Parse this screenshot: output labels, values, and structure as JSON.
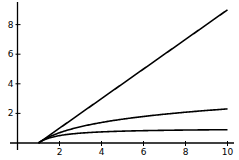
{
  "chart_data": {
    "type": "line",
    "title": "",
    "xlabel": "",
    "ylabel": "",
    "xlim": [
      0,
      10
    ],
    "ylim": [
      0,
      9
    ],
    "grid": false,
    "legend": null,
    "x_ticks": [
      "2",
      "4",
      "6",
      "8",
      "10"
    ],
    "y_ticks": [
      "2",
      "4",
      "6",
      "8"
    ],
    "x": [
      1,
      1.5,
      2,
      3,
      4,
      5,
      6,
      7,
      8,
      9,
      10
    ],
    "series": [
      {
        "name": "x - 1",
        "values": [
          0,
          0.5,
          1,
          2,
          3,
          4,
          5,
          6,
          7,
          8,
          9
        ]
      },
      {
        "name": "ln(x)",
        "values": [
          0,
          0.405,
          0.693,
          1.099,
          1.386,
          1.609,
          1.792,
          1.946,
          2.079,
          2.197,
          2.303
        ]
      },
      {
        "name": "1 - 1/x",
        "values": [
          0,
          0.333,
          0.5,
          0.667,
          0.75,
          0.8,
          0.833,
          0.857,
          0.875,
          0.889,
          0.9
        ]
      }
    ],
    "colors": {
      "line": "#000000",
      "axis": "#000000"
    }
  }
}
